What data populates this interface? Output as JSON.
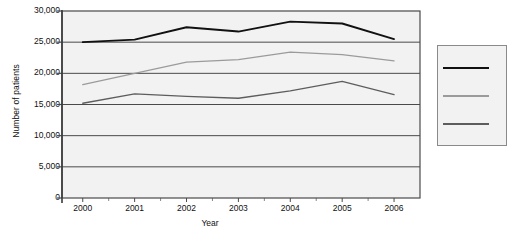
{
  "chart_data": {
    "type": "line",
    "title": "",
    "xlabel": "Year",
    "ylabel": "Number of patients",
    "x": [
      2000,
      2001,
      2002,
      2003,
      2004,
      2005,
      2006
    ],
    "categories": [
      "2000",
      "2001",
      "2002",
      "2003",
      "2004",
      "2005",
      "2006"
    ],
    "xtick_labels": [
      "2000",
      "2001",
      "2002",
      "2003",
      "2004",
      "2005",
      "2006"
    ],
    "ytick_labels": [
      "30,000",
      "25,000",
      "20,000",
      "15,000",
      "10,000",
      "5,000",
      "0"
    ],
    "ytick_values": [
      30000,
      25000,
      20000,
      15000,
      10000,
      5000,
      0
    ],
    "ylim": [
      0,
      30000
    ],
    "xlim": [
      1999.6,
      2006.5
    ],
    "grid": "horizontal",
    "legend_position": "right",
    "legend_labels": [
      "",
      "",
      ""
    ],
    "series": [
      {
        "name": "series-1",
        "color": "#111111",
        "values": [
          25000,
          25400,
          27400,
          26700,
          28300,
          28000,
          25500
        ]
      },
      {
        "name": "series-2",
        "color": "#9b9b9b",
        "values": [
          18200,
          20000,
          21800,
          22200,
          23400,
          23000,
          22000
        ]
      },
      {
        "name": "series-3",
        "color": "#5d5d5d",
        "values": [
          15200,
          16700,
          16300,
          16000,
          17200,
          18700,
          16600
        ]
      }
    ]
  },
  "axes": {
    "y_title": "Number of patients",
    "x_title": "Year"
  },
  "legend": {
    "rows": [
      {
        "name": "legend-item-1",
        "color": "#111111",
        "label": ""
      },
      {
        "name": "legend-item-2",
        "color": "#9b9b9b",
        "label": ""
      },
      {
        "name": "legend-item-3",
        "color": "#5d5d5d",
        "label": ""
      }
    ]
  }
}
